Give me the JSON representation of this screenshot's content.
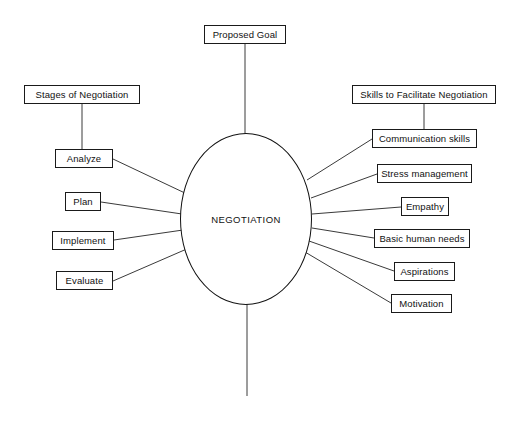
{
  "diagram": {
    "title": "NEGOTIATION",
    "type": "concept-map",
    "canvas": {
      "width": 511,
      "height": 429
    },
    "colors": {
      "background": "#ffffff",
      "stroke": "#111111",
      "text": "#111111",
      "connector": "#3a3a3a"
    },
    "center": {
      "label": "NEGOTIATION",
      "shape": "ellipse",
      "cx": 246,
      "cy": 219,
      "rx": 66,
      "ry": 86
    },
    "nodes": {
      "proposed_goal": {
        "label": "Proposed Goal",
        "x": 204,
        "y": 25,
        "w": 82,
        "h": 19
      },
      "goal_achievement": {
        "label": "Goal Achievement",
        "x": 199,
        "y": 396,
        "w": 97,
        "h": 19
      },
      "stages_header": {
        "label": "Stages of Negotiation",
        "x": 24,
        "y": 85,
        "w": 116,
        "h": 19
      },
      "skills_header": {
        "label": "Skills to Facilitate Negotiation",
        "x": 352,
        "y": 85,
        "w": 144,
        "h": 19
      },
      "analyze": {
        "label": "Analyze",
        "x": 55,
        "y": 149,
        "w": 58,
        "h": 19
      },
      "plan": {
        "label": "Plan",
        "x": 65,
        "y": 192,
        "w": 36,
        "h": 19
      },
      "implement": {
        "label": "Implement",
        "x": 52,
        "y": 231,
        "w": 62,
        "h": 19
      },
      "evaluate": {
        "label": "Evaluate",
        "x": 56,
        "y": 271,
        "w": 57,
        "h": 19
      },
      "communication_skills": {
        "label": "Communication skills",
        "x": 372,
        "y": 129,
        "w": 105,
        "h": 19
      },
      "stress_management": {
        "label": "Stress management",
        "x": 377,
        "y": 164,
        "w": 95,
        "h": 19
      },
      "empathy": {
        "label": "Empathy",
        "x": 401,
        "y": 197,
        "w": 48,
        "h": 19
      },
      "basic_human_needs": {
        "label": "Basic human needs",
        "x": 374,
        "y": 229,
        "w": 96,
        "h": 19
      },
      "aspirations": {
        "label": "Aspirations",
        "x": 394,
        "y": 262,
        "w": 61,
        "h": 19
      },
      "motivation": {
        "label": "Motivation",
        "x": 391,
        "y": 294,
        "w": 61,
        "h": 19
      }
    },
    "edges": [
      {
        "from": "proposed_goal",
        "to": "center",
        "x1": 245,
        "y1": 44,
        "x2": 245,
        "y2": 134
      },
      {
        "from": "center",
        "to": "goal_achievement",
        "x1": 247,
        "y1": 304,
        "x2": 247,
        "y2": 396
      },
      {
        "from": "stages_header",
        "to": "analyze",
        "x1": 82,
        "y1": 104,
        "x2": 82,
        "y2": 149
      },
      {
        "from": "skills_header",
        "to": "communication_skills",
        "x1": 424,
        "y1": 104,
        "x2": 424,
        "y2": 129
      },
      {
        "from": "analyze",
        "to": "center",
        "x1": 113,
        "y1": 159,
        "x2": 187,
        "y2": 194
      },
      {
        "from": "plan",
        "to": "center",
        "x1": 101,
        "y1": 202,
        "x2": 182,
        "y2": 214
      },
      {
        "from": "implement",
        "to": "center",
        "x1": 114,
        "y1": 240,
        "x2": 183,
        "y2": 230
      },
      {
        "from": "evaluate",
        "to": "center",
        "x1": 113,
        "y1": 281,
        "x2": 189,
        "y2": 248
      },
      {
        "from": "center",
        "to": "communication_skills",
        "x1": 307,
        "y1": 180,
        "x2": 372,
        "y2": 139
      },
      {
        "from": "center",
        "to": "stress_management",
        "x1": 311,
        "y1": 198,
        "x2": 377,
        "y2": 174
      },
      {
        "from": "center",
        "to": "empathy",
        "x1": 312,
        "y1": 214,
        "x2": 401,
        "y2": 207
      },
      {
        "from": "center",
        "to": "basic_human_needs",
        "x1": 312,
        "y1": 228,
        "x2": 374,
        "y2": 238
      },
      {
        "from": "center",
        "to": "aspirations",
        "x1": 309,
        "y1": 241,
        "x2": 394,
        "y2": 271
      },
      {
        "from": "center",
        "to": "motivation",
        "x1": 305,
        "y1": 252,
        "x2": 391,
        "y2": 303
      }
    ]
  }
}
